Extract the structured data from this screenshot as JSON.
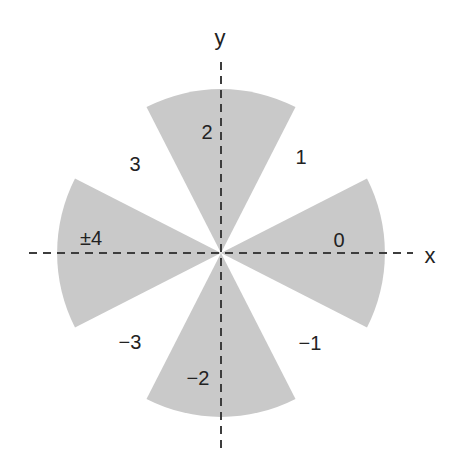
{
  "diagram": {
    "axes": {
      "x_label": "x",
      "y_label": "y"
    },
    "sector_labels": {
      "east": "0",
      "north": "2",
      "west": "±4",
      "south": "−2"
    },
    "gap_labels": {
      "northeast": "1",
      "northwest": "3",
      "southwest": "−3",
      "southeast": "−1"
    },
    "colors": {
      "sector_fill": "#c9c9c9",
      "axis_stroke": "#3d3d3d",
      "text": "#222222"
    }
  }
}
